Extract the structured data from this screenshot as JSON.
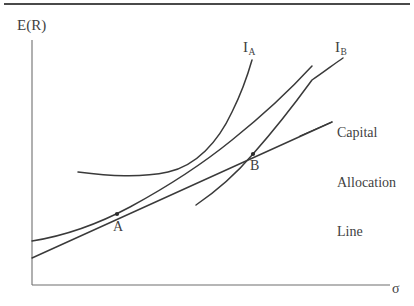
{
  "figure": {
    "title_rule": true,
    "background": "#ffffff",
    "ink_color": "#3f3f3f",
    "axis_color": "#6b6b6b"
  },
  "axes": {
    "y_label": "E(R)",
    "x_label": "σ",
    "y_axis": {
      "x": 32,
      "y_top": 40,
      "y_bottom": 285
    },
    "x_axis": {
      "y": 285,
      "x_left": 32,
      "x_right": 390
    }
  },
  "labels": {
    "indifference_a": {
      "base": "I",
      "sub": "A"
    },
    "indifference_b": {
      "base": "I",
      "sub": "B"
    },
    "cal_line_1": "Capital",
    "cal_line_2": "Allocation",
    "cal_line_3": "Line",
    "point_a": "A",
    "point_b": "B"
  },
  "chart_data": {
    "type": "line",
    "title": "",
    "xlabel": "σ",
    "ylabel": "E(R)",
    "grid": false,
    "legend": "none",
    "axis_ranges": {
      "x_px": [
        32,
        390
      ],
      "y_px": [
        40,
        285
      ]
    },
    "annotations": [
      {
        "name": "I_A",
        "text": "I_A",
        "x_px": 248,
        "y_px": 46
      },
      {
        "name": "I_B",
        "text": "I_B",
        "x_px": 340,
        "y_px": 46
      },
      {
        "name": "capital-allocation-line",
        "text": "Capital Allocation Line",
        "x_px": 337,
        "y_px": 99
      },
      {
        "name": "point-A",
        "text": "A",
        "x_px": 117,
        "y_px": 226
      },
      {
        "name": "point-B",
        "text": "B",
        "x_px": 255,
        "y_px": 165
      }
    ],
    "points": [
      {
        "name": "A",
        "x_px": 117,
        "y_px": 214,
        "marker": "dot"
      },
      {
        "name": "B",
        "x_px": 253,
        "y_px": 154,
        "marker": "dot"
      }
    ],
    "series": [
      {
        "name": "efficient-frontier",
        "kind": "curve",
        "path": "M 32 241 C 70 235, 100 223, 130 207 C 165 188, 200 166, 232 140 C 262 116, 290 90, 312 66"
      },
      {
        "name": "capital-allocation-line",
        "kind": "straight-line",
        "path": "M 32 258 L 332 122",
        "tangent_points": [
          "A",
          "B"
        ]
      },
      {
        "name": "indifference-curve-IA",
        "kind": "curve",
        "path": "M 78 172 C 110 176, 140 178, 168 172 C 196 166, 218 142, 232 112 C 242 92, 248 74, 252 60"
      },
      {
        "name": "indifference-curve-IB",
        "kind": "curve",
        "path": "M 196 205 C 218 190, 236 174, 253 154 C 276 128, 296 102, 312 80 C 324 72, 334 64, 343 58"
      }
    ]
  }
}
